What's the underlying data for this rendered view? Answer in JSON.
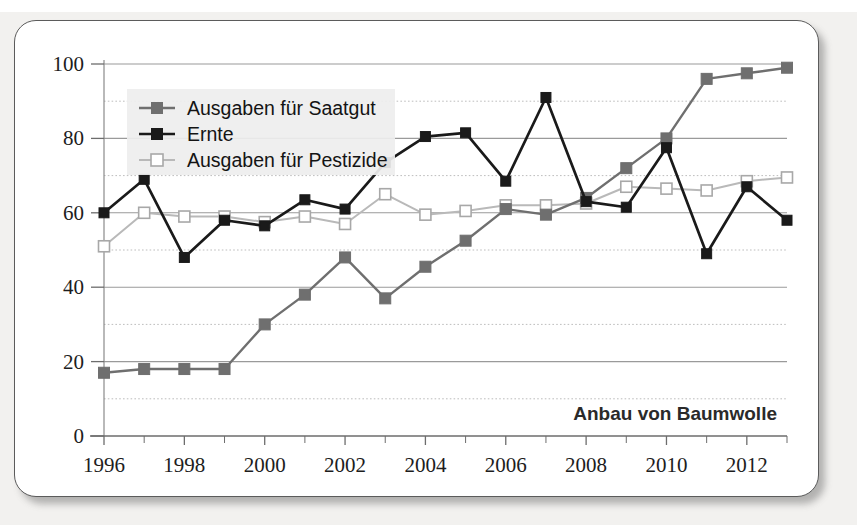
{
  "chart_data": {
    "type": "line",
    "title": "",
    "annotation": "Anbau von Baumwolle",
    "xlabel": "",
    "ylabel": "",
    "xlim": [
      1996,
      2013
    ],
    "ylim": [
      0,
      100
    ],
    "grid": true,
    "legend_position": "top-left",
    "x": [
      1996,
      1997,
      1998,
      1999,
      2000,
      2001,
      2002,
      2003,
      2004,
      2005,
      2006,
      2007,
      2008,
      2009,
      2010,
      2011,
      2012,
      2013
    ],
    "x_tick_labels": [
      "1996",
      "1998",
      "2000",
      "2002",
      "2004",
      "2006",
      "2008",
      "2010",
      "2012"
    ],
    "x_tick_values": [
      1996,
      1998,
      2000,
      2002,
      2004,
      2006,
      2008,
      2010,
      2012
    ],
    "y_tick_labels": [
      "0",
      "20",
      "40",
      "60",
      "80",
      "100"
    ],
    "y_tick_values": [
      0,
      20,
      40,
      60,
      80,
      100
    ],
    "y_minor_gridlines": [
      10,
      30,
      50,
      70,
      90
    ],
    "series": [
      {
        "name": "Ausgaben für Saatgut",
        "color": "#6f6f6f",
        "marker": "filled-square-grey",
        "values": [
          17,
          18,
          18,
          18,
          30,
          38,
          48,
          37,
          45.5,
          52.5,
          61,
          59.5,
          64,
          72,
          80,
          96,
          97.5,
          99
        ]
      },
      {
        "name": "Ernte",
        "color": "#1a1a1a",
        "marker": "filled-square-black",
        "values": [
          60,
          69,
          48,
          58,
          56.5,
          63.5,
          61,
          73.5,
          80.5,
          81.5,
          68.5,
          91,
          63,
          61.5,
          77.5,
          49,
          67,
          58
        ]
      },
      {
        "name": "Ausgaben für Pestizide",
        "color": "#b9b9b9",
        "marker": "open-square",
        "values": [
          51,
          60,
          59,
          59,
          57.5,
          59,
          57,
          65,
          59.5,
          60.5,
          62,
          62,
          62.5,
          67,
          66.5,
          66,
          68.5,
          69.5
        ]
      }
    ]
  },
  "legend": {
    "items": [
      {
        "label": "Ausgaben für Saatgut"
      },
      {
        "label": "Ernte"
      },
      {
        "label": "Ausgaben für Pestizide"
      }
    ]
  },
  "colors": {
    "seed_series": "#6f6f6f",
    "harvest_series": "#1a1a1a",
    "pesticide_series": "#b9b9b9",
    "axis": "#6d6d6d",
    "gridline": "#9a9a9a",
    "card_border": "#5b5b5b",
    "page_background": "#f2f1ef"
  }
}
